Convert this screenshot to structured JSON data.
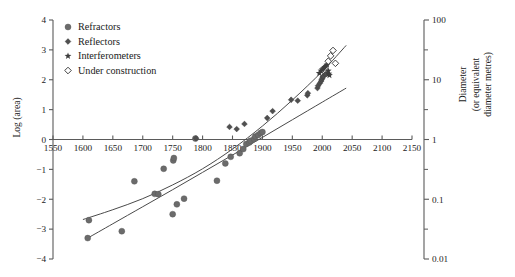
{
  "chart_data": {
    "type": "scatter",
    "title": "",
    "xlabel": "",
    "ylabel": "Log (area)",
    "y2label_line1": "Diameter",
    "y2label_line2": "(or equivalent",
    "y2label_line3": "diameter metres)",
    "xlim": [
      1550,
      2150
    ],
    "ylim": [
      -4,
      4
    ],
    "xticks": [
      1550,
      1600,
      1650,
      1700,
      1750,
      1800,
      1850,
      1900,
      1950,
      2000,
      2050,
      2100,
      2150
    ],
    "yticks": [
      -4,
      -3,
      -2,
      -1,
      0,
      1,
      2,
      3,
      4
    ],
    "y2_major_labels": [
      "100",
      "10",
      "1",
      "0.1",
      "0.01"
    ],
    "y2_major_values": [
      4,
      2,
      0,
      -2,
      -4
    ],
    "y2_minor_values": [
      3,
      1,
      -1,
      -3
    ],
    "grid": false,
    "legend_position": "upper-left-inside",
    "legend": [
      {
        "label": "Refractors",
        "marker": "circle"
      },
      {
        "label": "Reflectors",
        "marker": "diamond-filled"
      },
      {
        "label": "Interferometers",
        "marker": "star"
      },
      {
        "label": "Under construction",
        "marker": "diamond-open"
      }
    ],
    "series": [
      {
        "name": "Refractors",
        "marker": "circle",
        "points": [
          [
            1608,
            -3.3
          ],
          [
            1610,
            -2.7
          ],
          [
            1665,
            -3.07
          ],
          [
            1686,
            -1.4
          ],
          [
            1720,
            -1.82
          ],
          [
            1726,
            -1.83
          ],
          [
            1735,
            -0.98
          ],
          [
            1750,
            -2.5
          ],
          [
            1751,
            -0.7
          ],
          [
            1752,
            -0.62
          ],
          [
            1757,
            -2.17
          ],
          [
            1769,
            -1.98
          ],
          [
            1788,
            0.03
          ],
          [
            1824,
            -1.38
          ],
          [
            1838,
            -0.8
          ],
          [
            1847,
            -0.58
          ],
          [
            1862,
            -0.46
          ],
          [
            1868,
            -0.32
          ],
          [
            1873,
            -0.15
          ],
          [
            1878,
            -0.1
          ],
          [
            1880,
            -0.04
          ],
          [
            1886,
            0.02
          ],
          [
            1888,
            0.1
          ],
          [
            1893,
            0.15
          ],
          [
            1897,
            0.22
          ],
          [
            1900,
            0.25
          ]
        ]
      },
      {
        "name": "Reflectors",
        "marker": "diamond-filled",
        "points": [
          [
            1789,
            0.04
          ],
          [
            1845,
            0.42
          ],
          [
            1857,
            0.35
          ],
          [
            1870,
            0.52
          ],
          [
            1908,
            0.72
          ],
          [
            1917,
            0.95
          ],
          [
            1948,
            1.33
          ],
          [
            1959,
            1.3
          ],
          [
            1975,
            1.48
          ],
          [
            1976,
            1.55
          ],
          [
            1992,
            1.72
          ],
          [
            1993,
            1.8
          ],
          [
            1996,
            1.88
          ],
          [
            1998,
            1.95
          ],
          [
            1999,
            2.0
          ],
          [
            2000,
            2.05
          ],
          [
            2001,
            2.1
          ],
          [
            2002,
            2.12
          ],
          [
            2005,
            2.18
          ],
          [
            2007,
            2.2
          ]
        ]
      },
      {
        "name": "Interferometers",
        "marker": "star",
        "points": [
          [
            1995,
            2.22
          ],
          [
            1998,
            2.3
          ],
          [
            2000,
            2.34
          ],
          [
            2002,
            2.38
          ],
          [
            2004,
            2.42
          ],
          [
            2006,
            2.46
          ],
          [
            2008,
            2.5
          ],
          [
            2010,
            2.3
          ],
          [
            2011,
            2.2
          ],
          [
            2012,
            2.15
          ]
        ]
      },
      {
        "name": "Under construction",
        "marker": "diamond-open",
        "points": [
          [
            2010,
            2.62
          ],
          [
            2014,
            2.8
          ],
          [
            2018,
            2.98
          ],
          [
            2022,
            2.55
          ]
        ]
      }
    ],
    "fit_curves": [
      {
        "name": "upper-fit",
        "style": "solid",
        "points": [
          [
            1600,
            -2.68
          ],
          [
            1650,
            -2.35
          ],
          [
            1700,
            -1.98
          ],
          [
            1750,
            -1.52
          ],
          [
            1800,
            -0.98
          ],
          [
            1850,
            -0.32
          ],
          [
            1900,
            0.45
          ],
          [
            1950,
            1.32
          ],
          [
            2000,
            2.28
          ],
          [
            2040,
            3.15
          ]
        ]
      },
      {
        "name": "lower-fit",
        "style": "solid",
        "points": [
          [
            1608,
            -3.3
          ],
          [
            1650,
            -2.82
          ],
          [
            1700,
            -2.25
          ],
          [
            1750,
            -1.68
          ],
          [
            1800,
            -1.1
          ],
          [
            1850,
            -0.52
          ],
          [
            1900,
            0.07
          ],
          [
            1950,
            0.66
          ],
          [
            2000,
            1.25
          ],
          [
            2040,
            1.72
          ]
        ]
      }
    ]
  }
}
